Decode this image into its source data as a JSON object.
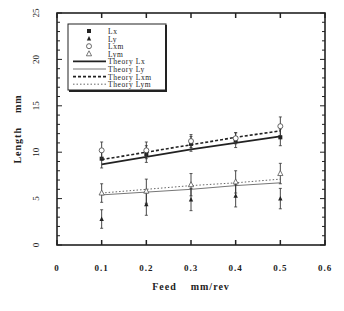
{
  "chart_data": {
    "type": "scatter",
    "title": "",
    "xlabel": "Feed    mm/rev",
    "ylabel": "Length    mm",
    "xlim": [
      0,
      0.6
    ],
    "ylim": [
      0,
      25
    ],
    "x_ticks": [
      "0",
      "0.1",
      "0.2",
      "0.3",
      "0.4",
      "0.5",
      "0.6"
    ],
    "y_ticks": [
      "0",
      "5",
      "10",
      "15",
      "20",
      "25"
    ],
    "grid": false,
    "legend_position": "upper-left",
    "x": [
      0.1,
      0.2,
      0.3,
      0.4,
      0.5
    ],
    "series": [
      {
        "name": "Lx",
        "kind": "points",
        "marker": "filled-square",
        "values": [
          9.3,
          9.8,
          10.9,
          11.3,
          11.6
        ],
        "err": [
          1.0,
          0.9,
          0.8,
          0.8,
          0.9
        ]
      },
      {
        "name": "Ly",
        "kind": "points",
        "marker": "filled-triangle",
        "values": [
          2.8,
          4.4,
          4.9,
          5.3,
          5.0
        ],
        "err": [
          1.0,
          1.2,
          1.2,
          1.2,
          1.1
        ]
      },
      {
        "name": "Lxm",
        "kind": "points",
        "marker": "open-circle",
        "values": [
          10.2,
          10.2,
          11.2,
          11.5,
          12.8
        ],
        "err": [
          0.9,
          0.9,
          0.7,
          0.6,
          1.0
        ]
      },
      {
        "name": "Lym",
        "kind": "points",
        "marker": "open-triangle",
        "values": [
          5.6,
          5.8,
          6.5,
          6.8,
          7.7
        ],
        "err": [
          1.0,
          1.3,
          1.2,
          1.2,
          1.1
        ]
      },
      {
        "name": "Theory  Lx",
        "kind": "line",
        "style": "solid-thick",
        "values": [
          8.7,
          9.5,
          10.3,
          11.0,
          11.7
        ]
      },
      {
        "name": "Theory  Ly",
        "kind": "line",
        "style": "solid-thin",
        "values": [
          5.4,
          5.7,
          6.0,
          6.4,
          6.7
        ]
      },
      {
        "name": "Theory  Lxm",
        "kind": "line",
        "style": "dashed",
        "values": [
          9.2,
          10.0,
          10.8,
          11.6,
          12.3
        ]
      },
      {
        "name": "Theory  Lym",
        "kind": "line",
        "style": "dotted",
        "values": [
          5.6,
          6.0,
          6.4,
          6.7,
          7.1
        ]
      }
    ]
  }
}
